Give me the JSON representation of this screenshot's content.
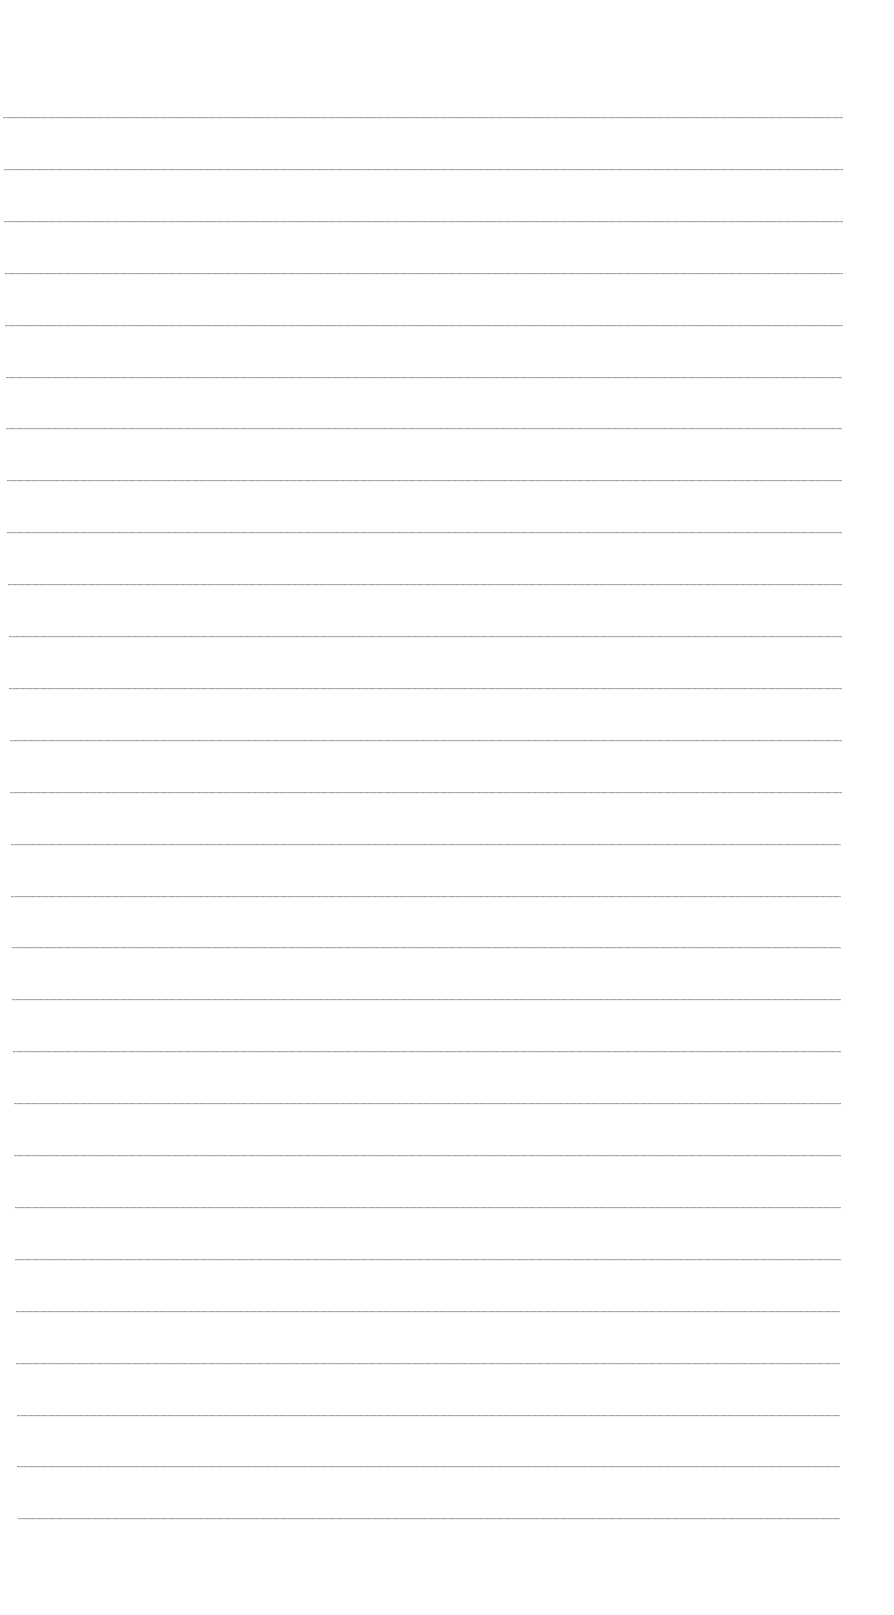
{
  "page": {
    "type": "blank lined paper",
    "background_color": "#ffffff",
    "line_color": "#9a9a9a"
  },
  "rules": {
    "count": 28,
    "first_y": 117,
    "spacing": 51.9,
    "x_start_top": 3,
    "x_start_bottom": 18,
    "x_end_top": 843,
    "x_end_bottom": 840
  }
}
